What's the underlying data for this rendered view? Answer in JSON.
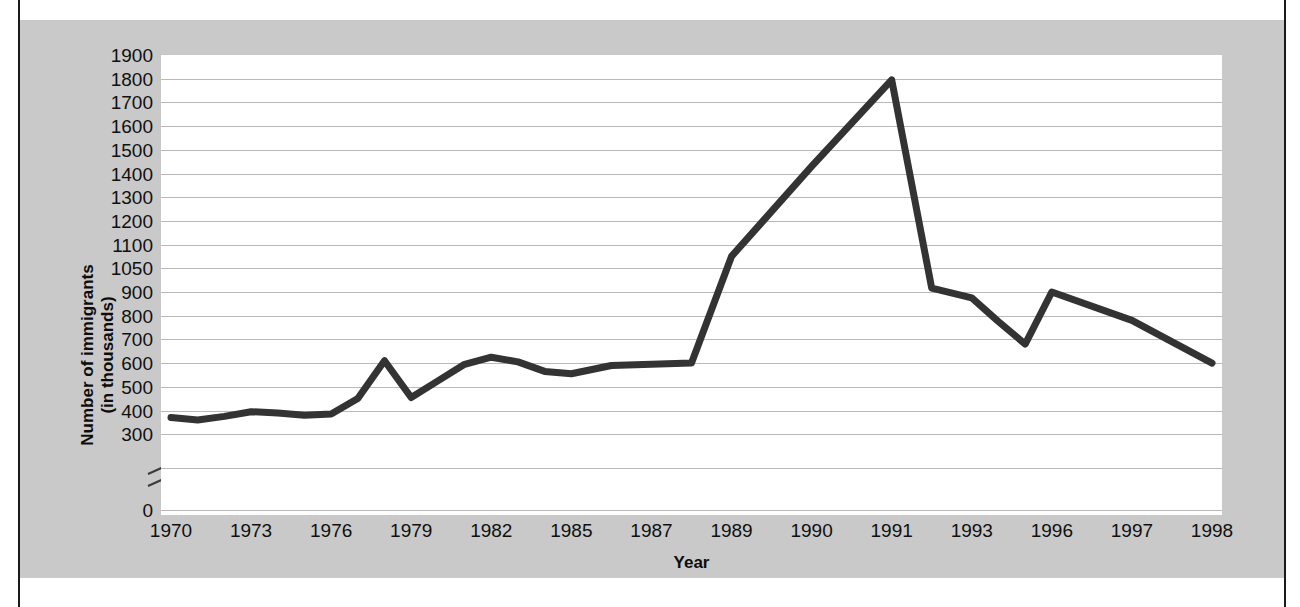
{
  "chart_data": {
    "type": "line",
    "title": "",
    "xlabel": "Year",
    "ylabel": "Number of immigrants\n(in thousands)",
    "ylabel_line1": "Number of immigrants",
    "ylabel_line2": "(in thousands)",
    "grid": true,
    "legend": false,
    "axis_break": "y-axis break between 0 and 300",
    "ylim": [
      0,
      1900
    ],
    "y_ticks": [
      1900,
      1800,
      1700,
      1600,
      1500,
      1400,
      1300,
      1200,
      1100,
      1050,
      900,
      800,
      700,
      600,
      500,
      400,
      300,
      0
    ],
    "x_ticks": [
      "1970",
      "1973",
      "1976",
      "1979",
      "1982",
      "1985",
      "1987",
      "1989",
      "1990",
      "1991",
      "1993",
      "1996",
      "1997",
      "1998"
    ],
    "x": [
      1970,
      1971,
      1972,
      1973,
      1974,
      1975,
      1976,
      1977,
      1978,
      1979,
      1980,
      1981,
      1982,
      1983,
      1984,
      1985,
      1986,
      1987,
      1988,
      1989,
      1990,
      1991,
      1992,
      1993,
      1994,
      1995,
      1996,
      1997,
      1998
    ],
    "values": [
      370,
      360,
      375,
      395,
      390,
      380,
      385,
      450,
      610,
      455,
      525,
      595,
      625,
      605,
      565,
      555,
      590,
      595,
      600,
      1075,
      1430,
      1795,
      925,
      875,
      775,
      680,
      900,
      780,
      600
    ],
    "series": [
      {
        "name": "Number of immigrants",
        "color": "#333333",
        "values": [
          370,
          360,
          375,
          395,
          390,
          380,
          385,
          450,
          610,
          455,
          525,
          595,
          625,
          605,
          565,
          555,
          590,
          595,
          600,
          1075,
          1430,
          1795,
          925,
          875,
          775,
          680,
          900,
          780,
          600
        ]
      }
    ],
    "line_color": "#333333",
    "grid_color": "#b9b9b9",
    "panel_color": "#c9c9c9",
    "plot_bg": "#ffffff"
  }
}
